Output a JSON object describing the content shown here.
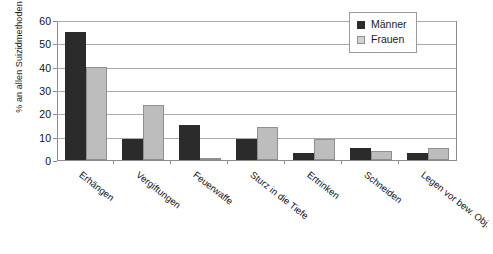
{
  "chart_data": {
    "type": "bar",
    "title": "",
    "xlabel": "",
    "ylabel": "% an allen Suizidmethoden",
    "ylim": [
      0,
      60
    ],
    "yticks": [
      0,
      10,
      20,
      30,
      40,
      50,
      60
    ],
    "grid": true,
    "legend_position": "top-right",
    "categories": [
      "Erhängen",
      "Vergiftungen",
      "Feuerwaffe",
      "Sturz in die Tiefe",
      "Ertrinken",
      "Schneiden",
      "Legen vor bew. Obj."
    ],
    "series": [
      {
        "name": "Männer",
        "color": "#2b2b2b",
        "values": [
          55,
          9,
          15,
          9,
          3,
          5,
          3
        ]
      },
      {
        "name": "Frauen",
        "color": "#bdbdbd",
        "values": [
          40,
          23.5,
          1,
          14,
          9,
          4,
          5
        ]
      }
    ]
  },
  "axis": {
    "tick_labels": [
      "60",
      "50",
      "40",
      "30",
      "20",
      "10",
      "0"
    ]
  },
  "legend": {
    "items": [
      {
        "label": "Männer"
      },
      {
        "label": "Frauen"
      }
    ]
  }
}
